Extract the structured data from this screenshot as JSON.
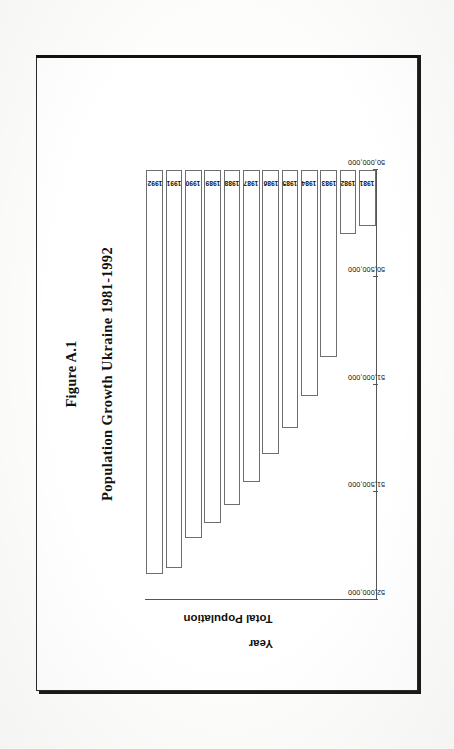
{
  "page": {
    "background_color": "#fdfdfc",
    "frame_color": "#1a1a1a"
  },
  "figure": {
    "figure_label": "Figure A.1",
    "title": "Population Growth Ukraine 1981-1992",
    "rotation": "-90deg"
  },
  "chart_data": {
    "type": "bar",
    "orientation": "vertical-rotated",
    "title": "Population Growth Ukraine 1981-1992",
    "xlabel": "Year",
    "ylabel": "Total Population",
    "categories": [
      "1981",
      "1982",
      "1983",
      "1984",
      "1985",
      "1986",
      "1987",
      "1988",
      "1989",
      "1990",
      "1991",
      "1992"
    ],
    "values": [
      50260000,
      50300000,
      50870000,
      51050000,
      51200000,
      51320000,
      51450000,
      51560000,
      51640000,
      51710000,
      51850000,
      51880000
    ],
    "series": [
      {
        "name": "Total Population",
        "values": [
          50260000,
          50300000,
          50870000,
          51050000,
          51200000,
          51320000,
          51450000,
          51560000,
          51640000,
          51710000,
          51850000,
          51880000
        ]
      }
    ],
    "ylim": [
      50000000,
      52000000
    ],
    "ytick_values": [
      50000000,
      50500000,
      51000000,
      51500000,
      52000000
    ],
    "ytick_labels": [
      "50,000,000",
      "50,500,000",
      "51,000,000",
      "51,500,000",
      "52,000,000"
    ],
    "grid": false,
    "legend": false,
    "bar_fill": "#ffffff",
    "bar_border": "#6e6e6e"
  },
  "axes": {
    "value_axis_title": "Total Population",
    "category_axis_title": "Year",
    "value_ticks": [
      "52,000,000",
      "51,500,000",
      "51,000,000",
      "50,500,000",
      "50,000,000"
    ],
    "category_ticks": [
      "1992",
      "1991",
      "1990",
      "1989",
      "1988",
      "1987",
      "1986",
      "1985",
      "1984",
      "1983",
      "1982",
      "1981"
    ]
  }
}
